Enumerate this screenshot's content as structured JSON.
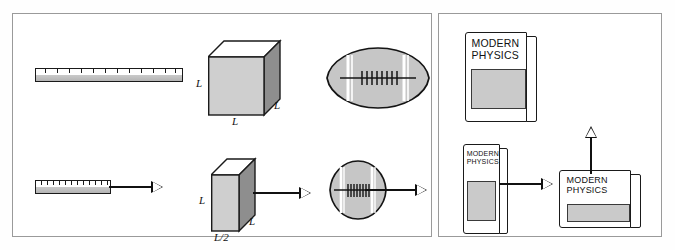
{
  "figure": {
    "caption_objects": [
      "ruler",
      "cube",
      "football",
      "book"
    ],
    "panels": [
      {
        "name": "rest-frame-and-moving-frame-panel"
      },
      {
        "name": "book-orientation-panel"
      }
    ]
  },
  "labels": {
    "cube_height": "L",
    "cube_depth": "L",
    "cube_width": "L",
    "contracted_box_height": "L",
    "contracted_box_depth": "L",
    "contracted_box_width": "L/2"
  },
  "book": {
    "title_line1": "MODERN",
    "title_line2": "PHYSICS"
  },
  "icons": {
    "velocity_arrow_right": "arrow-right-icon",
    "velocity_arrow_up": "arrow-up-icon"
  },
  "colors": {
    "outline": "#1a1a1a",
    "panel_border": "#9a9a9a",
    "face_front": "#cfcfcf",
    "face_side": "#8e8e8e",
    "face_top": "#ffffff",
    "football_fill": "#c6c6c6",
    "book_picture": "#cacaca",
    "background": "#ffffff"
  },
  "geometry": {
    "ruler_rest_ticks": 12,
    "ruler_moving_ticks": 12,
    "football_laces_rest": 8,
    "football_laces_moving": 8
  }
}
